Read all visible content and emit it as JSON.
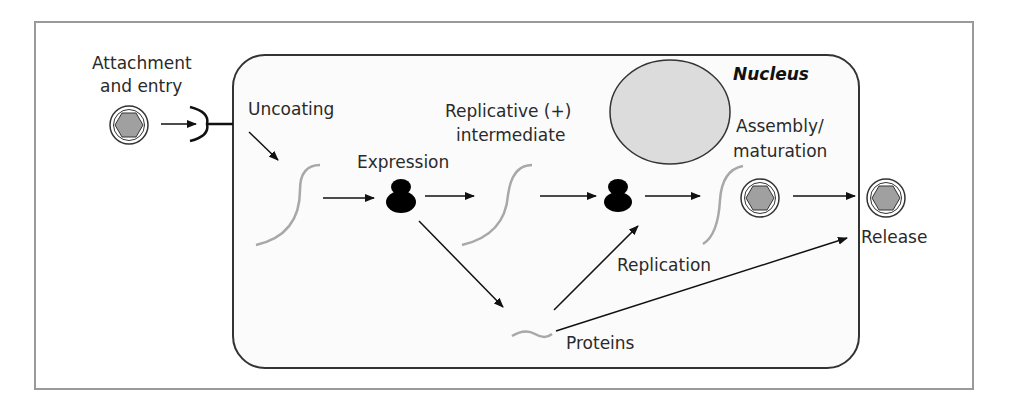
{
  "diagram": {
    "type": "viral life cycle",
    "labels": {
      "attachment_line1": "Attachment",
      "attachment_line2": "and entry",
      "uncoating": "Uncoating",
      "expression": "Expression",
      "replicative_line1": "Replicative (+)",
      "replicative_line2": "intermediate",
      "nucleus": "Nucleus",
      "assembly_line1": "Assembly/",
      "assembly_line2": "maturation",
      "replication": "Replication",
      "release": "Release",
      "proteins": "Proteins"
    },
    "steps": [
      "Attachment and entry",
      "Uncoating",
      "Expression",
      "Replicative (+) intermediate",
      "Replication",
      "Assembly/maturation",
      "Release"
    ],
    "colors": {
      "frame": "#9a9a9a",
      "cell_border": "#333333",
      "cell_fill": "#fbfbfb",
      "nucleus_fill": "#dcdcdc",
      "rna_strand": "#a8a8a8",
      "virion_fill": "#a0a0a0",
      "ribosome": "#000000"
    }
  }
}
